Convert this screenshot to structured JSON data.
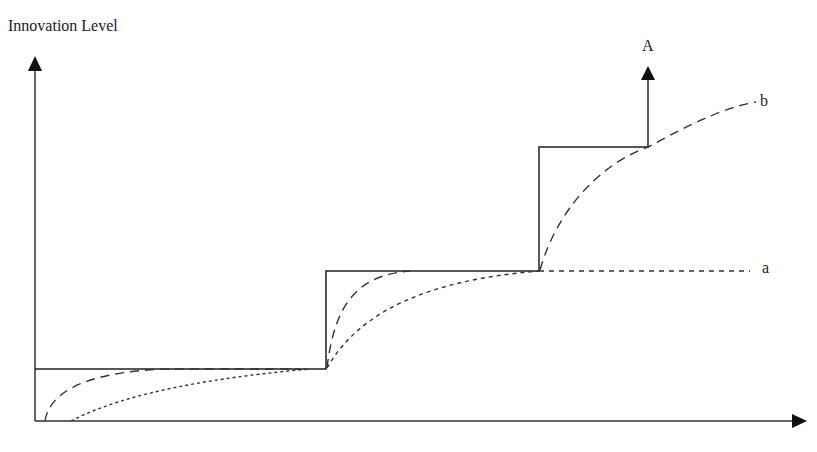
{
  "diagram": {
    "y_axis_label": "Innovation Level",
    "x_axis_label": "",
    "step_arrow_label": "A",
    "curve_labels": {
      "a": "a",
      "b": "b"
    },
    "elements": [
      {
        "id": "staircase",
        "style": "solid",
        "description": "Stepwise innovation level with three steps, ending in upward arrow labeled A"
      },
      {
        "id": "curve-a",
        "style": "dotted",
        "description": "Slow adoption curve approaching each step, levels off at second step (a)"
      },
      {
        "id": "curve-b",
        "style": "dashed",
        "description": "Fast adoption curve approaching each step, continues rising toward b"
      }
    ],
    "colors": {
      "line": "#222222",
      "background": "#ffffff"
    }
  }
}
